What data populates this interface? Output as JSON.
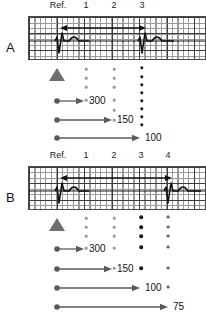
{
  "figure": {
    "type": "ecg-measurement-diagram",
    "panels": [
      {
        "id": "A",
        "letter": "A",
        "column_headers": [
          "Ref.",
          "1",
          "2",
          "3"
        ],
        "ecg": {
          "qrs_beats": 2,
          "interval_arrow": "double-headed",
          "grid": "ecg-paper"
        },
        "marker": "reference-triangle",
        "dot_columns": [
          {
            "column": "1",
            "count": 4,
            "color": "#999999",
            "size": 2.6
          },
          {
            "column": "2",
            "count": 6,
            "color": "#999999",
            "size": 2.6
          },
          {
            "column": "3",
            "count": 8,
            "color": "#1a1a1a",
            "size": 3.2
          }
        ],
        "measurements": [
          {
            "value": "300",
            "target_column": "1"
          },
          {
            "value": "150",
            "target_column": "2"
          },
          {
            "value": "100",
            "target_column": "3"
          }
        ]
      },
      {
        "id": "B",
        "letter": "B",
        "column_headers": [
          "Ref.",
          "1",
          "2",
          "3",
          "4"
        ],
        "ecg": {
          "qrs_beats": 2,
          "interval_arrow": "double-headed",
          "grid": "ecg-paper"
        },
        "marker": "reference-triangle",
        "dot_columns": [
          {
            "column": "1",
            "count": 4,
            "color": "#999999",
            "size": 2.6
          },
          {
            "column": "2",
            "count": 5,
            "color": "#999999",
            "size": 2.6
          },
          {
            "column": "3",
            "count": 5,
            "color": "#1a1a1a",
            "size": 3.4
          },
          {
            "column": "4",
            "count": 6,
            "color": "#666666",
            "size": 2.8
          }
        ],
        "measurements": [
          {
            "value": "300",
            "target_column": "1"
          },
          {
            "value": "150",
            "target_column": "2"
          },
          {
            "value": "100",
            "target_column": "3"
          },
          {
            "value": "75",
            "target_column": "4"
          }
        ]
      }
    ],
    "colors": {
      "grid_fine": "#9a9a9a",
      "grid_coarse": "#3d3d3d",
      "trace": "#1a1a1a",
      "arrow": "#5a5a5a",
      "triangle": "#6e6e6e",
      "text": "#141414"
    }
  }
}
